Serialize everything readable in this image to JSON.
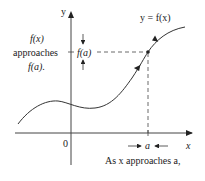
{
  "diagram": {
    "type": "limit-of-function-illustration",
    "axes": {
      "x_label": "x",
      "y_label": "y",
      "origin_label": "0"
    },
    "curve_label": "y = f(x)",
    "point": {
      "x_label": "a",
      "y_label": "f(a)"
    },
    "left_annotation": {
      "line1": "f(x)",
      "line2": "approaches",
      "line3": "f(a)."
    },
    "bottom_annotation": "As x approaches a,",
    "colors": {
      "ink": "#222222",
      "background": "#ffffff"
    }
  }
}
